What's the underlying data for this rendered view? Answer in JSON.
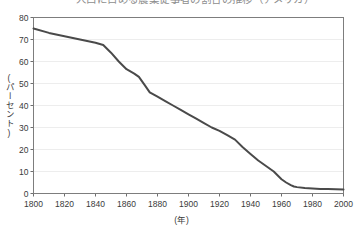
{
  "top_clipped_text": "人口に占める農業従事者の割合の推移（アメリカ）",
  "chart_data": {
    "type": "line",
    "title": "",
    "xlabel": "(年)",
    "ylabel": "(パーセント)",
    "xlim": [
      1800,
      2000
    ],
    "ylim": [
      0,
      80
    ],
    "xticks": [
      1800,
      1820,
      1840,
      1860,
      1880,
      1900,
      1920,
      1940,
      1960,
      1980,
      2000
    ],
    "yticks": [
      0,
      10,
      20,
      30,
      40,
      50,
      60,
      70,
      80
    ],
    "xtick_labels": [
      "1800",
      "1820",
      "1840",
      "1860",
      "1880",
      "1900",
      "1920",
      "1940",
      "1960",
      "1980",
      "2000"
    ],
    "ytick_labels": [
      "0",
      "10",
      "20",
      "30",
      "40",
      "50",
      "60",
      "70",
      "80"
    ],
    "grid": "horizontal",
    "legend": "none",
    "series": [
      {
        "name": "割合",
        "color": "#4a4a4a",
        "x": [
          1800,
          1810,
          1820,
          1830,
          1840,
          1845,
          1850,
          1855,
          1860,
          1865,
          1868,
          1872,
          1875,
          1880,
          1885,
          1890,
          1895,
          1900,
          1905,
          1910,
          1915,
          1920,
          1925,
          1930,
          1935,
          1940,
          1945,
          1950,
          1955,
          1960,
          1963,
          1966,
          1968,
          1970,
          1975,
          1980,
          1985,
          1990,
          1995,
          2000
        ],
        "y": [
          75,
          73,
          71.5,
          70,
          68.5,
          67.5,
          64,
          60,
          56.5,
          54.5,
          53,
          49,
          46,
          44,
          42,
          40,
          38,
          36,
          34,
          32,
          30,
          28.5,
          26.5,
          24.5,
          21,
          18,
          15,
          12.5,
          10,
          6.5,
          5,
          3.8,
          3.2,
          2.9,
          2.5,
          2.3,
          2.1,
          2.0,
          1.9,
          1.8
        ]
      }
    ]
  },
  "style": {
    "line_color": "#4a4a4a",
    "frame_color": "#7d7d7d",
    "grid_color": "#ededed",
    "tick_color": "#6e6e6e",
    "text_color": "#3a3a3a",
    "background": "#ffffff"
  }
}
